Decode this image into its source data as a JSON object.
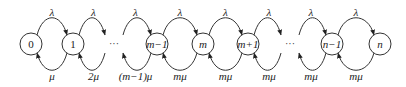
{
  "diagram": {
    "type": "birth-death-chain",
    "nodes": [
      {
        "id": "0",
        "label": "0",
        "x": 31,
        "italic": false
      },
      {
        "id": "1",
        "label": "1",
        "x": 73,
        "italic": false
      },
      {
        "id": "dots1",
        "label": "···",
        "x": 114,
        "ellipsis": true
      },
      {
        "id": "m-1",
        "label": "m−1",
        "x": 157,
        "italic": true
      },
      {
        "id": "m",
        "label": "m",
        "x": 203,
        "italic": true
      },
      {
        "id": "m+1",
        "label": "m+1",
        "x": 248,
        "italic": true
      },
      {
        "id": "dots2",
        "label": "···",
        "x": 290,
        "ellipsis": true
      },
      {
        "id": "n-1",
        "label": "n−1",
        "x": 332,
        "italic": true
      },
      {
        "id": "n",
        "label": "n",
        "x": 380,
        "italic": true
      }
    ],
    "forward_rates": [
      {
        "from": "0",
        "to": "1",
        "label": "λ"
      },
      {
        "from": "1",
        "to": "dots1",
        "label": "λ"
      },
      {
        "from": "dots1",
        "to": "m-1",
        "label": "λ"
      },
      {
        "from": "m-1",
        "to": "m",
        "label": "λ"
      },
      {
        "from": "m",
        "to": "m+1",
        "label": "λ"
      },
      {
        "from": "m+1",
        "to": "dots2",
        "label": "λ"
      },
      {
        "from": "dots2",
        "to": "n-1",
        "label": "λ"
      },
      {
        "from": "n-1",
        "to": "n",
        "label": "λ"
      }
    ],
    "backward_rates": [
      {
        "from": "1",
        "to": "0",
        "label": "μ"
      },
      {
        "from": "dots1",
        "to": "1",
        "label": "2μ"
      },
      {
        "from": "m-1",
        "to": "dots1",
        "label": "(m−1)μ"
      },
      {
        "from": "m",
        "to": "m-1",
        "label": "mμ"
      },
      {
        "from": "m+1",
        "to": "m",
        "label": "mμ"
      },
      {
        "from": "dots2",
        "to": "m+1",
        "label": "mμ"
      },
      {
        "from": "n-1",
        "to": "dots2",
        "label": "mμ"
      },
      {
        "from": "n",
        "to": "n-1",
        "label": "mμ"
      }
    ]
  }
}
